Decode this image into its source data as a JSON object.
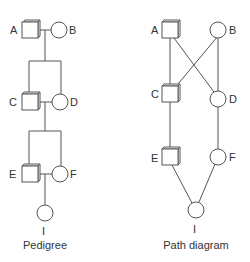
{
  "pedigree": {
    "caption": "Pedigree",
    "nodes": {
      "A": {
        "label": "A",
        "shape": "square"
      },
      "B": {
        "label": "B",
        "shape": "circle"
      },
      "C": {
        "label": "C",
        "shape": "square"
      },
      "D": {
        "label": "D",
        "shape": "circle"
      },
      "E": {
        "label": "E",
        "shape": "square"
      },
      "F": {
        "label": "F",
        "shape": "circle"
      },
      "I": {
        "label": "I",
        "shape": "circle"
      }
    }
  },
  "path_diagram": {
    "caption": "Path diagram",
    "nodes": {
      "A": {
        "label": "A",
        "shape": "square"
      },
      "B": {
        "label": "B",
        "shape": "circle"
      },
      "C": {
        "label": "C",
        "shape": "square"
      },
      "D": {
        "label": "D",
        "shape": "circle"
      },
      "E": {
        "label": "E",
        "shape": "square"
      },
      "F": {
        "label": "F",
        "shape": "circle"
      },
      "I": {
        "label": "I",
        "shape": "circle"
      }
    },
    "edges": [
      [
        "A",
        "C"
      ],
      [
        "A",
        "D"
      ],
      [
        "B",
        "C"
      ],
      [
        "B",
        "D"
      ],
      [
        "C",
        "E"
      ],
      [
        "D",
        "F"
      ],
      [
        "E",
        "I"
      ],
      [
        "F",
        "I"
      ]
    ]
  }
}
